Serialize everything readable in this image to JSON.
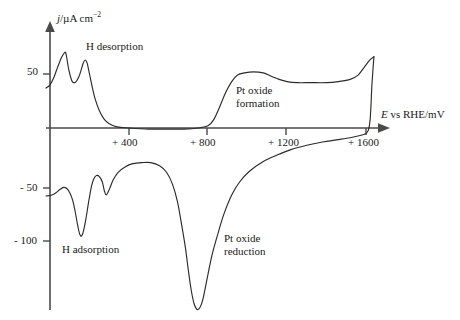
{
  "figure": {
    "background_color": "#ffffff",
    "line_color": "#2b2b2b",
    "axis_color": "#4a4a4a"
  },
  "axes": {
    "y_label_prefix": "j",
    "y_label_rest": "/µA cm",
    "y_label_exp": "−2",
    "x_label_prefix": "E",
    "x_label_rest": " vs RHE/mV",
    "y_ticks": [
      {
        "label": "50",
        "value": 50
      },
      {
        "label": "- 50",
        "value": -50
      },
      {
        "label": "- 100",
        "value": -100
      }
    ],
    "x_ticks": [
      {
        "label": "+ 400",
        "value": 400
      },
      {
        "label": "+ 800",
        "value": 800
      },
      {
        "label": "+ 1200",
        "value": 1200
      },
      {
        "label": "+ 1600",
        "value": 1600
      }
    ]
  },
  "annotations": [
    {
      "id": "h-desorption",
      "text": "H desorption"
    },
    {
      "id": "h-adsorption",
      "text": "H adsorption"
    },
    {
      "id": "pt-oxide-formation-line1",
      "text": "Pt oxide"
    },
    {
      "id": "pt-oxide-formation-line2",
      "text": "formation"
    },
    {
      "id": "pt-oxide-reduction-line1",
      "text": "Pt oxide"
    },
    {
      "id": "pt-oxide-reduction-line2",
      "text": "reduction"
    }
  ],
  "chart_data": {
    "type": "line",
    "title": "",
    "xlabel": "E vs RHE/mV",
    "ylabel": "j/µA cm−2",
    "xlim": [
      -20,
      1700
    ],
    "ylim": [
      -170,
      75
    ],
    "grid": false,
    "legend": null,
    "series": [
      {
        "name": "anodic-sweep",
        "description": "Forward (positive-going) scan: H desorption peaks then Pt oxide formation plateau",
        "points": [
          [
            -20,
            37
          ],
          [
            0,
            40
          ],
          [
            20,
            47
          ],
          [
            40,
            57
          ],
          [
            60,
            66
          ],
          [
            75,
            70
          ],
          [
            82,
            68
          ],
          [
            95,
            54
          ],
          [
            110,
            44
          ],
          [
            120,
            42
          ],
          [
            132,
            43
          ],
          [
            145,
            47
          ],
          [
            155,
            52
          ],
          [
            168,
            60
          ],
          [
            178,
            63
          ],
          [
            188,
            60
          ],
          [
            200,
            50
          ],
          [
            215,
            37
          ],
          [
            230,
            26
          ],
          [
            250,
            16
          ],
          [
            275,
            8
          ],
          [
            300,
            4
          ],
          [
            340,
            1
          ],
          [
            400,
            0
          ],
          [
            500,
            -1
          ],
          [
            600,
            -1
          ],
          [
            680,
            -1
          ],
          [
            750,
            0
          ],
          [
            800,
            2
          ],
          [
            830,
            8
          ],
          [
            860,
            20
          ],
          [
            890,
            33
          ],
          [
            920,
            43
          ],
          [
            950,
            49
          ],
          [
            985,
            51
          ],
          [
            1030,
            52
          ],
          [
            1080,
            51
          ],
          [
            1120,
            48
          ],
          [
            1160,
            45
          ],
          [
            1200,
            43
          ],
          [
            1250,
            42
          ],
          [
            1320,
            42
          ],
          [
            1400,
            42
          ],
          [
            1460,
            43
          ],
          [
            1520,
            45
          ],
          [
            1560,
            49
          ],
          [
            1590,
            56
          ],
          [
            1620,
            63
          ],
          [
            1640,
            66
          ]
        ]
      },
      {
        "name": "cathodic-sweep",
        "description": "Reverse (negative-going) scan: Pt oxide reduction peak then H adsorption peaks",
        "points": [
          [
            1640,
            66
          ],
          [
            1630,
            40
          ],
          [
            1625,
            20
          ],
          [
            1620,
            6
          ],
          [
            1612,
            -2
          ],
          [
            1600,
            -5
          ],
          [
            1570,
            -7
          ],
          [
            1520,
            -9
          ],
          [
            1450,
            -11
          ],
          [
            1380,
            -13
          ],
          [
            1300,
            -16
          ],
          [
            1220,
            -20
          ],
          [
            1150,
            -25
          ],
          [
            1080,
            -31
          ],
          [
            1010,
            -40
          ],
          [
            960,
            -50
          ],
          [
            920,
            -62
          ],
          [
            880,
            -80
          ],
          [
            850,
            -98
          ],
          [
            820,
            -118
          ],
          [
            795,
            -140
          ],
          [
            775,
            -158
          ],
          [
            760,
            -166
          ],
          [
            745,
            -168
          ],
          [
            730,
            -163
          ],
          [
            715,
            -150
          ],
          [
            700,
            -131
          ],
          [
            685,
            -110
          ],
          [
            665,
            -88
          ],
          [
            645,
            -68
          ],
          [
            620,
            -52
          ],
          [
            590,
            -41
          ],
          [
            555,
            -35
          ],
          [
            510,
            -32
          ],
          [
            465,
            -32
          ],
          [
            420,
            -33
          ],
          [
            380,
            -36
          ],
          [
            345,
            -41
          ],
          [
            320,
            -48
          ],
          [
            300,
            -57
          ],
          [
            285,
            -62
          ],
          [
            275,
            -58
          ],
          [
            265,
            -50
          ],
          [
            250,
            -45
          ],
          [
            235,
            -44
          ],
          [
            222,
            -47
          ],
          [
            210,
            -54
          ],
          [
            196,
            -68
          ],
          [
            182,
            -84
          ],
          [
            170,
            -95
          ],
          [
            160,
            -100
          ],
          [
            150,
            -98
          ],
          [
            140,
            -90
          ],
          [
            128,
            -78
          ],
          [
            115,
            -67
          ],
          [
            100,
            -60
          ],
          [
            85,
            -56
          ],
          [
            68,
            -55
          ],
          [
            50,
            -57
          ],
          [
            30,
            -60
          ],
          [
            10,
            -62
          ],
          [
            -20,
            -63
          ]
        ]
      }
    ]
  }
}
